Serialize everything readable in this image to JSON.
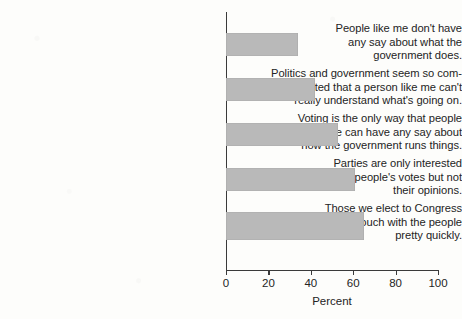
{
  "chart_data": {
    "type": "bar",
    "orientation": "horizontal",
    "title": "",
    "subtitle": "",
    "xlabel": "Percent",
    "ylabel": "",
    "xlim": [
      0,
      100
    ],
    "xticks": [
      "0",
      "20",
      "40",
      "60",
      "80",
      "100"
    ],
    "grid": false,
    "legend": false,
    "bar_color": "#b9b9b9",
    "axis_color": "#3a3a3a",
    "text_color": "#242424",
    "categories": [
      "People like me don't have any say about what the government does.",
      "Politics and government seem so complicated that a person like me can't really understand what's going on.",
      "Voting is the only way that people like me can have any say about how the government runs things.",
      "Parties are only interested in people's votes but not their opinions.",
      "Those we elect to Congress lose touch with the people pretty quickly."
    ],
    "category_lines": [
      [
        "People like me don't have",
        "any say about what the",
        "government does."
      ],
      [
        "Politics and government seem so com-",
        "plicated that a person like me can't",
        "really understand what's going on."
      ],
      [
        "Voting is the only way that people",
        "like me can have any say about",
        "how the government runs things."
      ],
      [
        "Parties are only interested",
        "in people's votes but not",
        "their opinions."
      ],
      [
        "Those we elect to Congress",
        "lose touch with the people",
        "pretty quickly."
      ]
    ],
    "values": [
      34,
      42,
      53,
      61,
      65
    ]
  }
}
